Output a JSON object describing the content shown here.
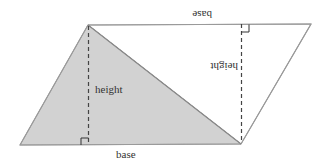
{
  "diagram": {
    "colors": {
      "shaded_fill": "#d2d2d2",
      "unshaded_fill": "#ffffff",
      "outline": "#9a9a9a",
      "dashed": "#444444",
      "text": "#333333"
    },
    "labels": {
      "bottom_base": "base",
      "left_height": "height",
      "top_base_rotated": "base",
      "right_height_rotated": "height"
    },
    "vertices": {
      "bottom_left": [
        20,
        145
      ],
      "top_left": [
        88,
        25
      ],
      "top_right": [
        311,
        24
      ],
      "bottom_right": [
        241,
        144
      ]
    }
  }
}
